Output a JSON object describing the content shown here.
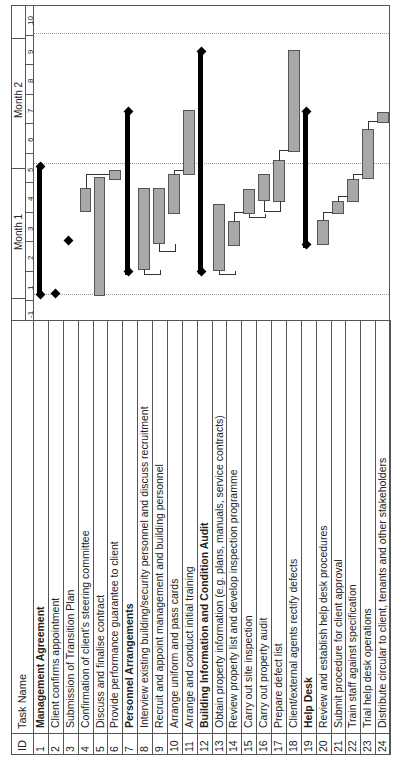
{
  "header": {
    "id_label": "ID",
    "task_name_label": "Task Name",
    "month1": "Month 1",
    "month2": "Month 2",
    "ticks": [
      "-1",
      "1",
      "2",
      "3",
      "4",
      "5",
      "6",
      "7",
      "8",
      "9",
      "10"
    ]
  },
  "tasks": [
    {
      "id": "1",
      "name": "Management Agreement",
      "summary": true
    },
    {
      "id": "2",
      "name": "Client confirms appointment",
      "summary": false
    },
    {
      "id": "3",
      "name": "Submission of Transition Plan",
      "summary": false
    },
    {
      "id": "4",
      "name": "Confirmation of client's steering committee",
      "summary": false
    },
    {
      "id": "5",
      "name": "Discuss and finalise contract",
      "summary": false
    },
    {
      "id": "6",
      "name": "Provide performance guarantee to client",
      "summary": false
    },
    {
      "id": "7",
      "name": "Personnel Arrangements",
      "summary": true
    },
    {
      "id": "8",
      "name": "Interview existing building/security personnel and discuss recruitment",
      "summary": false
    },
    {
      "id": "9",
      "name": "Recruit and appoint management and building personnel",
      "summary": false
    },
    {
      "id": "10",
      "name": "Arrange uniform and pass cards",
      "summary": false
    },
    {
      "id": "11",
      "name": "Arrange and conduct initial training",
      "summary": false
    },
    {
      "id": "12",
      "name": "Building Information and Condition Audit",
      "summary": true
    },
    {
      "id": "13",
      "name": "Obtain property information (e.g. plans, manuals, service contracts)",
      "summary": false
    },
    {
      "id": "14",
      "name": "Review property list and develop inspection programme",
      "summary": false
    },
    {
      "id": "15",
      "name": "Carry out site inspection",
      "summary": false
    },
    {
      "id": "16",
      "name": "Carry out property audit",
      "summary": false
    },
    {
      "id": "17",
      "name": "Prepare defect list",
      "summary": false
    },
    {
      "id": "18",
      "name": "Client/external agents rectify defects",
      "summary": false
    },
    {
      "id": "19",
      "name": "Help Desk",
      "summary": true
    },
    {
      "id": "20",
      "name": "Review and establish help desk procedures",
      "summary": false
    },
    {
      "id": "21",
      "name": "Submit procedure for client approval",
      "summary": false
    },
    {
      "id": "22",
      "name": "Train staff against specification",
      "summary": false
    },
    {
      "id": "23",
      "name": "Trial help desk operations",
      "summary": false
    },
    {
      "id": "24",
      "name": "Distribute circular to client, tenants and other stakeholders",
      "summary": false
    }
  ],
  "colors": {
    "task_bar": "#a8a8a8",
    "summary_bar": "#000000",
    "milestone": "#000000",
    "grid": "#555555"
  },
  "chart_data": {
    "type": "gantt",
    "orientation": "rotated-90-ccw",
    "title": "",
    "time_axis": {
      "units": "day",
      "ticks": [
        -1,
        1,
        2,
        3,
        4,
        5,
        6,
        7,
        8,
        9,
        10
      ],
      "groups": [
        {
          "label": "Month 1",
          "from": 0.5,
          "to": 5.5
        },
        {
          "label": "Month 2",
          "from": 5.5,
          "to": 10.5
        }
      ]
    },
    "tasks": [
      {
        "id": 1,
        "type": "summary",
        "start": 0.75,
        "end": 5.2
      },
      {
        "id": 2,
        "type": "milestone",
        "at": 0.75
      },
      {
        "id": 3,
        "type": "milestone",
        "at": 2.6
      },
      {
        "id": 4,
        "type": "task",
        "start": 3.6,
        "end": 4.4
      },
      {
        "id": 5,
        "type": "task",
        "start": 0.75,
        "end": 5.0
      },
      {
        "id": 6,
        "type": "task",
        "start": 4.8,
        "end": 5.2
      },
      {
        "id": 7,
        "type": "summary",
        "start": 1.5,
        "end": 7.1
      },
      {
        "id": 8,
        "type": "task",
        "start": 1.6,
        "end": 4.4
      },
      {
        "id": 9,
        "type": "task",
        "start": 2.2,
        "end": 4.4
      },
      {
        "id": 10,
        "type": "task",
        "start": 3.6,
        "end": 4.9
      },
      {
        "id": 11,
        "type": "task",
        "start": 4.9,
        "end": 7.0
      },
      {
        "id": 12,
        "type": "summary",
        "start": 1.5,
        "end": 9.2
      },
      {
        "id": 13,
        "type": "task",
        "start": 1.5,
        "end": 3.9
      },
      {
        "id": 14,
        "type": "task",
        "start": 2.5,
        "end": 3.4
      },
      {
        "id": 15,
        "type": "task",
        "start": 3.4,
        "end": 4.1
      },
      {
        "id": 16,
        "type": "task",
        "start": 3.6,
        "end": 4.8
      },
      {
        "id": 17,
        "type": "task",
        "start": 3.6,
        "end": 5.1
      },
      {
        "id": 18,
        "type": "task",
        "start": 5.6,
        "end": 9.0
      },
      {
        "id": 19,
        "type": "summary",
        "start": 2.3,
        "end": 7.0
      },
      {
        "id": 20,
        "type": "task",
        "start": 2.2,
        "end": 2.9
      },
      {
        "id": 21,
        "type": "task",
        "start": 3.2,
        "end": 3.6
      },
      {
        "id": 22,
        "type": "task",
        "start": 3.5,
        "end": 4.3
      },
      {
        "id": 23,
        "type": "task",
        "start": 4.8,
        "end": 6.3
      },
      {
        "id": 24,
        "type": "task",
        "start": 6.5,
        "end": 6.8
      }
    ],
    "dependencies": [
      [
        5,
        6
      ],
      [
        4,
        6
      ],
      [
        8,
        9
      ],
      [
        9,
        10
      ],
      [
        10,
        11
      ],
      [
        13,
        14
      ],
      [
        14,
        15
      ],
      [
        15,
        16
      ],
      [
        15,
        17
      ],
      [
        16,
        17
      ],
      [
        17,
        18
      ],
      [
        20,
        21
      ],
      [
        21,
        22
      ],
      [
        22,
        23
      ],
      [
        23,
        24
      ]
    ]
  }
}
